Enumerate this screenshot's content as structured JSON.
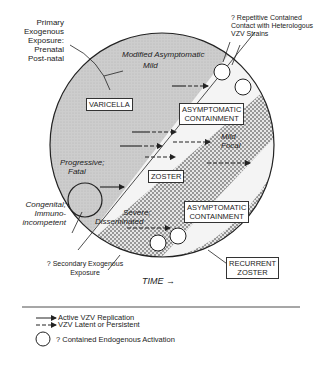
{
  "diagram": {
    "title_annotations": {
      "primary_exposure": [
        "Primary",
        "Exogenous",
        "Exposure:",
        "Prenatal",
        "Post-natal"
      ],
      "repetitive_contact": [
        "? Repetitive Contained",
        "Contact with Heterologous",
        "VZV Strains"
      ],
      "congenital": [
        "Congenital;",
        "Immuno-",
        "incompetent"
      ],
      "secondary_exposure": [
        "? Secondary Exogenous",
        "Exposure"
      ]
    },
    "regions": {
      "varicella": "VARICELLA",
      "asymptomatic_top": [
        "ASYMPTOMATIC",
        "CONTAINMENT"
      ],
      "zoster": "ZOSTER",
      "asymptomatic_bottom": [
        "ASYMPTOMATIC",
        "CONTAINMENT"
      ],
      "recurrent_zoster": [
        "RECURRENT",
        "ZOSTER"
      ]
    },
    "italic_labels": {
      "modified": "Modified Asymptomatic",
      "mild": "Mild",
      "progressive": "Progressive;",
      "fatal": "Fatal",
      "mild_focal_1": "Mild",
      "mild_focal_2": "Focal",
      "severe": "Severe;",
      "disseminated": "Disseminated"
    },
    "time_axis": "TIME →",
    "colors": {
      "varicella_fill": "#c9c9c9",
      "zoster_fill": "#8a8a8a",
      "containment_fill": "#ececec",
      "stroke": "#222222"
    }
  },
  "legend": {
    "items": [
      {
        "symbol": "solid-arrow",
        "label": "Active VZV Replication"
      },
      {
        "symbol": "dashed-arrow",
        "label": "VZV Latent or Persistent"
      },
      {
        "symbol": "circle",
        "label": "? Contained Endogenous Activation"
      }
    ]
  }
}
